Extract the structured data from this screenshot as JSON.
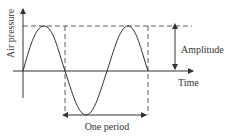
{
  "diagram": {
    "title": "",
    "labels": {
      "y_axis": "Air pressure",
      "x_axis": "Time",
      "amplitude": "Amplitude",
      "period": "One period"
    },
    "colors": {
      "line": "#333333",
      "background": "#ffffff"
    },
    "geometry": {
      "wave": "sine",
      "cycles_shown": 1.5
    }
  }
}
